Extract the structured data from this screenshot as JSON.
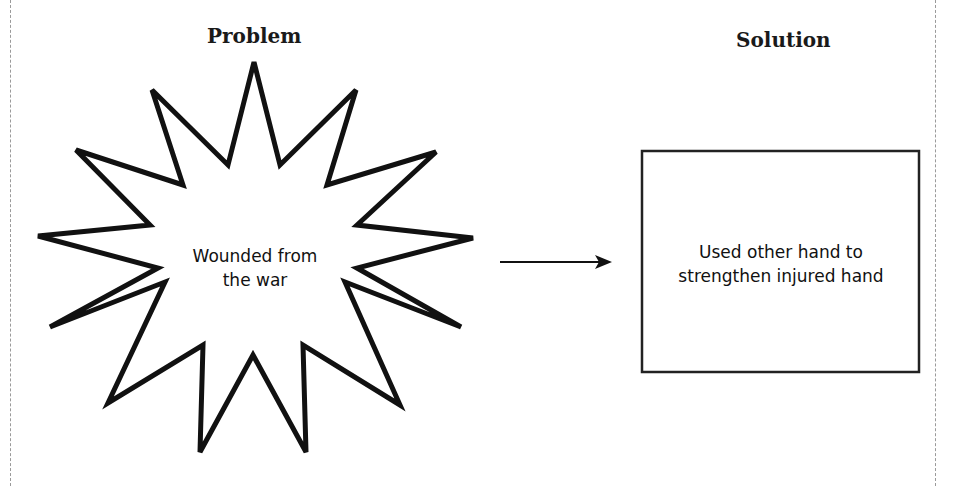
{
  "problem": {
    "heading": "Problem",
    "shape": "starburst",
    "text_line1": "Wounded from",
    "text_line2": "the war"
  },
  "solution": {
    "heading": "Solution",
    "shape": "rectangle",
    "text_line1": "Used other hand to",
    "text_line2": "strengthen injured hand"
  },
  "connector": {
    "type": "arrow",
    "direction": "right"
  },
  "colors": {
    "stroke": "#111111",
    "background": "#ffffff",
    "border": "#9a9a9a"
  }
}
